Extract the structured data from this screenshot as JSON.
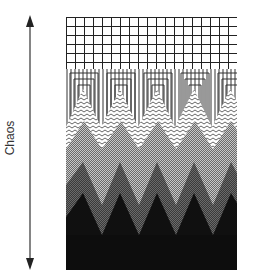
{
  "axis": {
    "label": "Chaos",
    "direction": "bidirectional-vertical",
    "arrow_color": "#333333"
  },
  "diagram": {
    "type": "layered-pattern-gradient",
    "layers": [
      {
        "name": "grid",
        "pattern": "square-grid",
        "color": "#222222"
      },
      {
        "name": "nested-columns",
        "pattern": "nested-rectangles",
        "color": "#333333"
      },
      {
        "name": "wavy-lines",
        "pattern": "zigzag-lines",
        "color": "#555555"
      },
      {
        "name": "checker-light",
        "pattern": "fine-checker",
        "color": "#9a9a9a"
      },
      {
        "name": "gray-mountains",
        "pattern": "dark-checker",
        "color": "#555555"
      },
      {
        "name": "black-base",
        "pattern": "solid",
        "color": "#0d0d0d"
      }
    ],
    "peak_count": 5
  }
}
